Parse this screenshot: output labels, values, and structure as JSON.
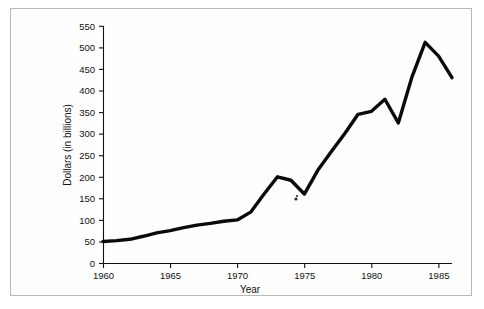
{
  "figure": {
    "border_color": "#b9b9b9",
    "background": "#ffffff"
  },
  "chart_data": {
    "type": "line",
    "title": "",
    "xlabel": "Year",
    "ylabel": "Dollars (in billions)",
    "xlim": [
      1960,
      1986
    ],
    "ylim": [
      0,
      550
    ],
    "xticks": [
      1960,
      1965,
      1970,
      1975,
      1980,
      1985
    ],
    "xtick_labels": [
      "1960",
      "1965",
      "1970",
      "1975",
      "1980",
      "1985"
    ],
    "yticks": [
      0,
      50,
      100,
      150,
      200,
      250,
      300,
      350,
      400,
      450,
      500,
      550
    ],
    "ytick_labels": [
      "0",
      "50",
      "100",
      "150",
      "200",
      "250",
      "300",
      "350",
      "400",
      "450",
      "500",
      "550"
    ],
    "grid": false,
    "legend": false,
    "line_color": "#0a0a0a",
    "line_width": 3.4,
    "markers": false,
    "x": [
      1960,
      1961,
      1962,
      1963,
      1964,
      1965,
      1966,
      1967,
      1968,
      1969,
      1970,
      1971,
      1972,
      1973,
      1974,
      1975,
      1976,
      1977,
      1978,
      1979,
      1980,
      1981,
      1982,
      1983,
      1984,
      1985,
      1986
    ],
    "values": [
      50,
      52,
      55,
      58,
      68,
      75,
      82,
      88,
      92,
      95,
      97,
      105,
      112,
      108,
      150,
      200,
      195,
      160,
      215,
      260,
      300,
      340,
      352,
      350,
      380,
      325,
      430
    ],
    "series": [
      {
        "name": "Dollars (in billions)",
        "values": [
          50,
          52,
          55,
          58,
          68,
          75,
          82,
          88,
          92,
          95,
          97,
          105,
          112,
          108,
          150,
          200,
          195,
          160,
          215,
          260,
          300,
          340,
          352,
          350,
          380,
          325,
          430
        ]
      }
    ],
    "annotations": []
  },
  "plot_geometry": {
    "left_px": 103,
    "right_px": 452,
    "top_px": 26,
    "bottom_px": 263,
    "x_data_start": 1960,
    "x_data_end": 1986,
    "vertices": [
      [
        1960,
        50
      ],
      [
        1961,
        52
      ],
      [
        1962,
        55
      ],
      [
        1963,
        62
      ],
      [
        1964,
        70
      ],
      [
        1965,
        75
      ],
      [
        1966,
        82
      ],
      [
        1967,
        88
      ],
      [
        1968,
        92
      ],
      [
        1969,
        97
      ],
      [
        1970,
        100
      ],
      [
        1971,
        118
      ],
      [
        1972,
        160
      ],
      [
        1973,
        200
      ],
      [
        1974,
        192
      ],
      [
        1975,
        160
      ],
      [
        1976,
        215
      ],
      [
        1977,
        258
      ],
      [
        1978,
        300
      ],
      [
        1979,
        345
      ],
      [
        1980,
        352
      ],
      [
        1981,
        380
      ],
      [
        1982,
        325
      ],
      [
        1983,
        430
      ],
      [
        1984,
        512
      ],
      [
        1985,
        480
      ],
      [
        1986,
        430
      ]
    ]
  }
}
